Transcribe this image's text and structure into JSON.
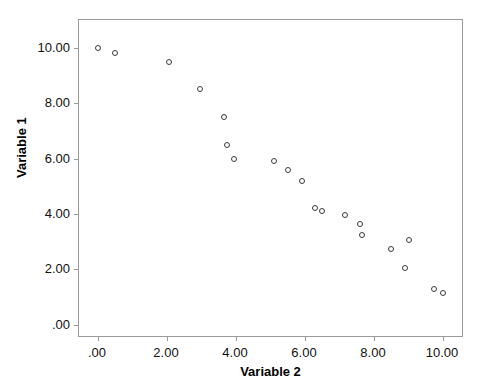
{
  "chart_data": {
    "type": "scatter",
    "title": "",
    "xlabel": "Variable 2",
    "ylabel": "Variable 1",
    "xlim": [
      -0.55,
      10.55
    ],
    "ylim": [
      -0.4,
      11.0
    ],
    "xticks": [
      0,
      2,
      4,
      6,
      8,
      10
    ],
    "yticks": [
      0,
      2,
      4,
      6,
      8,
      10
    ],
    "xticklabels": [
      ".00",
      "2.00",
      "4.00",
      "6.00",
      "8.00",
      "10.00"
    ],
    "yticklabels": [
      ".00",
      "2.00",
      "4.00",
      "6.00",
      "8.00",
      "10.00"
    ],
    "grid": false,
    "legend": false,
    "marker": "open-circle",
    "marker_color": "#3b3b3b",
    "frame_color": "#9a9a9a",
    "background": "#ffffff",
    "series": [
      {
        "name": "Variable 1 vs Variable 2",
        "points": [
          {
            "x": 0.0,
            "y": 10.0
          },
          {
            "x": 0.5,
            "y": 9.8
          },
          {
            "x": 2.05,
            "y": 9.5
          },
          {
            "x": 2.95,
            "y": 8.5
          },
          {
            "x": 3.65,
            "y": 7.5
          },
          {
            "x": 3.75,
            "y": 6.5
          },
          {
            "x": 3.95,
            "y": 6.0
          },
          {
            "x": 5.1,
            "y": 5.9
          },
          {
            "x": 5.5,
            "y": 5.6
          },
          {
            "x": 5.9,
            "y": 5.2
          },
          {
            "x": 6.3,
            "y": 4.2
          },
          {
            "x": 6.5,
            "y": 4.1
          },
          {
            "x": 7.15,
            "y": 3.95
          },
          {
            "x": 7.6,
            "y": 3.65
          },
          {
            "x": 7.65,
            "y": 3.25
          },
          {
            "x": 8.5,
            "y": 2.75
          },
          {
            "x": 9.0,
            "y": 3.05
          },
          {
            "x": 8.9,
            "y": 2.05
          },
          {
            "x": 9.75,
            "y": 1.3
          },
          {
            "x": 10.0,
            "y": 1.15
          }
        ]
      }
    ]
  }
}
